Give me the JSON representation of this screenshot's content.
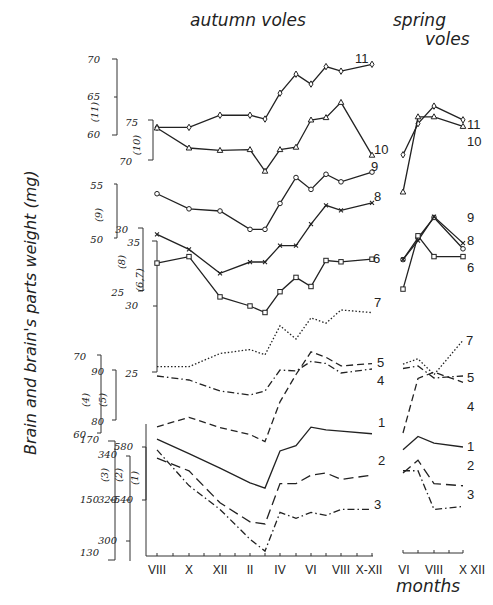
{
  "titles": {
    "autumn": "autumn   voles",
    "spring_line1": "spring",
    "spring_line2": "voles",
    "ylabel": "Brain and brain's parts weight (mg)",
    "xlabel": "months"
  },
  "chart_data": {
    "type": "line",
    "xlabel": "months",
    "ylabel": "Brain and brain's parts weight (mg)",
    "grid": false,
    "panels": [
      {
        "name": "autumn voles",
        "x": [
          "VIII",
          "IX",
          "X",
          "XI",
          "XII",
          "I",
          "II",
          "III",
          "IV",
          "V",
          "VI",
          "VII",
          "VIII",
          "IX",
          "X-XII"
        ],
        "tick_labels": [
          "VIII",
          "X",
          "XII",
          "II",
          "IV",
          "VI",
          "VIII",
          "X-XII"
        ]
      },
      {
        "name": "spring voles",
        "x": [
          "VI",
          "VII",
          "VIII",
          "IX",
          "X",
          "XI",
          "XII"
        ],
        "tick_labels": [
          "VI",
          "VIII",
          "X",
          "XII"
        ]
      }
    ],
    "y_axes": [
      {
        "series": "(11)",
        "ticks": [
          60,
          65,
          70
        ]
      },
      {
        "series": "(10)",
        "ticks": [
          70,
          75
        ]
      },
      {
        "series": "(9)",
        "ticks": [
          50,
          55
        ]
      },
      {
        "series": "(8)",
        "ticks": [
          25,
          30
        ]
      },
      {
        "series": "(6,7)",
        "ticks": [
          25,
          30,
          35
        ]
      },
      {
        "series": "(4)",
        "ticks": [
          60,
          70
        ]
      },
      {
        "series": "(5)",
        "ticks": [
          80,
          90
        ]
      },
      {
        "series": "(3)",
        "ticks": [
          130,
          150,
          170
        ]
      },
      {
        "series": "(2)",
        "ticks": [
          300,
          320,
          340
        ]
      },
      {
        "series": "(1)",
        "ticks": [
          540,
          580
        ]
      }
    ],
    "series": [
      {
        "name": "11",
        "marker": "diamond",
        "style": "solid",
        "autumn": [
          {
            "x": "VIII",
            "y": 61.0
          },
          {
            "x": "X",
            "y": 61.0
          },
          {
            "x": "XII",
            "y": 62.6
          },
          {
            "x": "II",
            "y": 62.6
          },
          {
            "x": "III",
            "y": 62.1
          },
          {
            "x": "IV",
            "y": 65.5
          },
          {
            "x": "V",
            "y": 68.0
          },
          {
            "x": "VI",
            "y": 66.7
          },
          {
            "x": "VII",
            "y": 69.0
          },
          {
            "x": "VIII",
            "y": 68.4
          },
          {
            "x": "X-XII",
            "y": 69.3
          }
        ],
        "spring": [
          {
            "x": "VI",
            "y": 57.4
          },
          {
            "x": "VII",
            "y": 61.5
          },
          {
            "x": "VIII",
            "y": 63.8
          },
          {
            "x": "X",
            "y": 62.0
          }
        ]
      },
      {
        "name": "10",
        "marker": "triangle",
        "style": "solid",
        "autumn": [
          {
            "x": "VIII",
            "y": 74.0
          },
          {
            "x": "X",
            "y": 71.5
          },
          {
            "x": "XII",
            "y": 71.2
          },
          {
            "x": "II",
            "y": 71.3
          },
          {
            "x": "III",
            "y": 68.6
          },
          {
            "x": "IV",
            "y": 71.3
          },
          {
            "x": "V",
            "y": 71.6
          },
          {
            "x": "VI",
            "y": 75.0
          },
          {
            "x": "VII",
            "y": 75.3
          },
          {
            "x": "VIII",
            "y": 77.2
          },
          {
            "x": "X-XII",
            "y": 70.6
          }
        ],
        "spring": [
          {
            "x": "VI",
            "y": 66.0
          },
          {
            "x": "VII",
            "y": 75.4
          },
          {
            "x": "VIII",
            "y": 75.4
          },
          {
            "x": "X",
            "y": 74.2
          }
        ]
      },
      {
        "name": "9",
        "marker": "circle",
        "style": "solid",
        "autumn": [
          {
            "x": "VIII",
            "y": 54.1
          },
          {
            "x": "X",
            "y": 52.7
          },
          {
            "x": "XII",
            "y": 52.5
          },
          {
            "x": "II",
            "y": 50.8
          },
          {
            "x": "III",
            "y": 50.8
          },
          {
            "x": "IV",
            "y": 53.2
          },
          {
            "x": "V",
            "y": 55.6
          },
          {
            "x": "VI",
            "y": 54.5
          },
          {
            "x": "VII",
            "y": 55.9
          },
          {
            "x": "VIII",
            "y": 55.2
          },
          {
            "x": "X-XII",
            "y": 56.1
          }
        ],
        "spring": [
          {
            "x": "VI",
            "y": 48.0
          },
          {
            "x": "VII",
            "y": 50.0
          },
          {
            "x": "VIII",
            "y": 51.9
          },
          {
            "x": "X",
            "y": 49.0
          }
        ]
      },
      {
        "name": "8",
        "marker": "cross",
        "style": "solid",
        "autumn": [
          {
            "x": "VIII",
            "y": 29.5
          },
          {
            "x": "X",
            "y": 28.3
          },
          {
            "x": "XII",
            "y": 26.4
          },
          {
            "x": "II",
            "y": 27.3
          },
          {
            "x": "III",
            "y": 27.3
          },
          {
            "x": "IV",
            "y": 28.6
          },
          {
            "x": "V",
            "y": 28.6
          },
          {
            "x": "VI",
            "y": 30.3
          },
          {
            "x": "VII",
            "y": 31.8
          },
          {
            "x": "VIII",
            "y": 31.4
          },
          {
            "x": "X-XII",
            "y": 32.0
          }
        ],
        "spring": [
          {
            "x": "VI",
            "y": 27.5
          },
          {
            "x": "VII",
            "y": 29.0
          },
          {
            "x": "VIII",
            "y": 30.9
          },
          {
            "x": "X",
            "y": 28.8
          }
        ]
      },
      {
        "name": "6",
        "marker": "square",
        "style": "solid",
        "autumn": [
          {
            "x": "VIII",
            "y": 33.3
          },
          {
            "x": "X",
            "y": 33.8
          },
          {
            "x": "XII",
            "y": 30.7
          },
          {
            "x": "II",
            "y": 30.0
          },
          {
            "x": "III",
            "y": 29.5
          },
          {
            "x": "IV",
            "y": 31.1
          },
          {
            "x": "V",
            "y": 32.2
          },
          {
            "x": "VI",
            "y": 31.5
          },
          {
            "x": "VII",
            "y": 33.5
          },
          {
            "x": "VIII",
            "y": 33.4
          },
          {
            "x": "X-XII",
            "y": 33.6
          }
        ],
        "spring": [
          {
            "x": "VI",
            "y": 31.3
          },
          {
            "x": "VII",
            "y": 35.4
          },
          {
            "x": "VIII",
            "y": 33.8
          },
          {
            "x": "X",
            "y": 33.8
          }
        ]
      },
      {
        "name": "7",
        "marker": "none",
        "style": "dotted",
        "autumn": [
          {
            "x": "VIII",
            "y": 25.4
          },
          {
            "x": "X",
            "y": 25.4
          },
          {
            "x": "XII",
            "y": 26.4
          },
          {
            "x": "II",
            "y": 26.7
          },
          {
            "x": "III",
            "y": 26.3
          },
          {
            "x": "IV",
            "y": 28.5
          },
          {
            "x": "V",
            "y": 27.5
          },
          {
            "x": "VI",
            "y": 29.1
          },
          {
            "x": "VII",
            "y": 28.7
          },
          {
            "x": "VIII",
            "y": 29.7
          },
          {
            "x": "X-XII",
            "y": 29.5
          }
        ],
        "spring": [
          {
            "x": "VI",
            "y": 25.6
          },
          {
            "x": "VII",
            "y": 26.0
          },
          {
            "x": "VIII",
            "y": 24.8
          },
          {
            "x": "X",
            "y": 27.4
          }
        ]
      },
      {
        "name": "5",
        "marker": "none",
        "style": "dash-dot",
        "autumn": [
          {
            "x": "VIII",
            "y": 88.8
          },
          {
            "x": "X",
            "y": 88.0
          },
          {
            "x": "XII",
            "y": 85.8
          },
          {
            "x": "II",
            "y": 85.0
          },
          {
            "x": "III",
            "y": 85.8
          },
          {
            "x": "IV",
            "y": 90.0
          },
          {
            "x": "V",
            "y": 89.8
          },
          {
            "x": "VI",
            "y": 91.7
          },
          {
            "x": "VII",
            "y": 91.3
          },
          {
            "x": "VIII",
            "y": 89.4
          },
          {
            "x": "X-XII",
            "y": 90.2
          }
        ],
        "spring": [
          {
            "x": "VI",
            "y": 90.3
          },
          {
            "x": "VII",
            "y": 90.8
          },
          {
            "x": "VIII",
            "y": 88.4
          },
          {
            "x": "X",
            "y": 88.8
          }
        ]
      },
      {
        "name": "4",
        "marker": "none",
        "style": "dashed",
        "autumn": [
          {
            "x": "VIII",
            "y": 60.8
          },
          {
            "x": "X",
            "y": 62.0
          },
          {
            "x": "XII",
            "y": 60.7
          },
          {
            "x": "II",
            "y": 59.8
          },
          {
            "x": "III",
            "y": 58.9
          },
          {
            "x": "IV",
            "y": 64.0
          },
          {
            "x": "V",
            "y": 67.5
          },
          {
            "x": "VI",
            "y": 70.4
          },
          {
            "x": "VII",
            "y": 69.7
          },
          {
            "x": "VIII",
            "y": 68.6
          },
          {
            "x": "X-XII",
            "y": 68.9
          }
        ],
        "spring": [
          {
            "x": "VI",
            "y": 60.0
          },
          {
            "x": "VII",
            "y": 67.0
          },
          {
            "x": "VIII",
            "y": 67.8
          },
          {
            "x": "X",
            "y": 66.5
          }
        ]
      },
      {
        "name": "1",
        "marker": "none",
        "style": "solid",
        "autumn": [
          {
            "x": "VIII",
            "y": 586
          },
          {
            "x": "X",
            "y": 575
          },
          {
            "x": "XII",
            "y": 564
          },
          {
            "x": "II",
            "y": 553
          },
          {
            "x": "III",
            "y": 549
          },
          {
            "x": "IV",
            "y": 577
          },
          {
            "x": "V",
            "y": 581
          },
          {
            "x": "VI",
            "y": 595
          },
          {
            "x": "VII",
            "y": 593
          },
          {
            "x": "VIII",
            "y": 592
          },
          {
            "x": "X-XII",
            "y": 590
          }
        ],
        "spring": [
          {
            "x": "VI",
            "y": 578
          },
          {
            "x": "VII",
            "y": 588
          },
          {
            "x": "VIII",
            "y": 583
          },
          {
            "x": "X",
            "y": 580
          }
        ]
      },
      {
        "name": "2",
        "marker": "none",
        "style": "long-dash",
        "autumn": [
          {
            "x": "VIII",
            "y": 339
          },
          {
            "x": "X",
            "y": 333
          },
          {
            "x": "XII",
            "y": 318
          },
          {
            "x": "II",
            "y": 309
          },
          {
            "x": "III",
            "y": 308
          },
          {
            "x": "IV",
            "y": 327
          },
          {
            "x": "V",
            "y": 327
          },
          {
            "x": "VI",
            "y": 331
          },
          {
            "x": "VII",
            "y": 332
          },
          {
            "x": "VIII",
            "y": 329
          },
          {
            "x": "X-XII",
            "y": 331
          }
        ],
        "spring": [
          {
            "x": "VI",
            "y": 332
          },
          {
            "x": "VII",
            "y": 338
          },
          {
            "x": "VIII",
            "y": 327
          },
          {
            "x": "X",
            "y": 326
          }
        ]
      },
      {
        "name": "3",
        "marker": "none",
        "style": "dash-dot",
        "autumn": [
          {
            "x": "VIII",
            "y": 167
          },
          {
            "x": "X",
            "y": 155
          },
          {
            "x": "XII",
            "y": 147
          },
          {
            "x": "II",
            "y": 137
          },
          {
            "x": "III",
            "y": 133
          },
          {
            "x": "IV",
            "y": 146
          },
          {
            "x": "V",
            "y": 144
          },
          {
            "x": "VI",
            "y": 146
          },
          {
            "x": "VII",
            "y": 145
          },
          {
            "x": "VIII",
            "y": 147
          },
          {
            "x": "X-XII",
            "y": 147
          }
        ],
        "spring": [
          {
            "x": "VI",
            "y": 160
          },
          {
            "x": "VII",
            "y": 160
          },
          {
            "x": "VIII",
            "y": 147
          },
          {
            "x": "X",
            "y": 148
          }
        ]
      }
    ]
  },
  "axis_labels": [
    {
      "text": "70",
      "x": 100,
      "y": 60
    },
    {
      "text": "65",
      "x": 100,
      "y": 97
    },
    {
      "text": "60",
      "x": 100,
      "y": 135
    },
    {
      "text": "(11)",
      "x": 98,
      "y": 112,
      "rot": true
    },
    {
      "text": "75",
      "x": 138,
      "y": 123
    },
    {
      "text": "70",
      "x": 132,
      "y": 162
    },
    {
      "text": "(10)",
      "x": 140,
      "y": 145,
      "rot": true
    },
    {
      "text": "55",
      "x": 103,
      "y": 186
    },
    {
      "text": "50",
      "x": 103,
      "y": 240
    },
    {
      "text": "(9)",
      "x": 102,
      "y": 215,
      "rot": true
    },
    {
      "text": "30",
      "x": 128,
      "y": 230
    },
    {
      "text": "25",
      "x": 124,
      "y": 293
    },
    {
      "text": "(8)",
      "x": 125,
      "y": 262,
      "rot": true
    },
    {
      "text": "35",
      "x": 140,
      "y": 243
    },
    {
      "text": "30",
      "x": 138,
      "y": 306
    },
    {
      "text": "25",
      "x": 138,
      "y": 374
    },
    {
      "text": "(6,7)",
      "x": 143,
      "y": 280,
      "rot": true
    },
    {
      "text": "70",
      "x": 86,
      "y": 357
    },
    {
      "text": "60",
      "x": 86,
      "y": 435
    },
    {
      "text": "(4)",
      "x": 89,
      "y": 400,
      "rot": true
    },
    {
      "text": "90",
      "x": 104,
      "y": 372
    },
    {
      "text": "80",
      "x": 104,
      "y": 422
    },
    {
      "text": "(5)",
      "x": 106,
      "y": 400,
      "rot": true
    },
    {
      "text": "170",
      "x": 99,
      "y": 440
    },
    {
      "text": "150",
      "x": 99,
      "y": 500
    },
    {
      "text": "130",
      "x": 99,
      "y": 553
    },
    {
      "text": "(3)",
      "x": 108,
      "y": 475,
      "rot": true
    },
    {
      "text": "340",
      "x": 117,
      "y": 455
    },
    {
      "text": "320",
      "x": 117,
      "y": 500
    },
    {
      "text": "300",
      "x": 117,
      "y": 541
    },
    {
      "text": "(2)",
      "x": 122,
      "y": 475,
      "rot": true
    },
    {
      "text": "580",
      "x": 133,
      "y": 447
    },
    {
      "text": "540",
      "x": 133,
      "y": 500
    },
    {
      "text": "(1)",
      "x": 138,
      "y": 478,
      "rot": true
    }
  ],
  "series_labels": [
    {
      "text": "11",
      "x": 355,
      "y": 59
    },
    {
      "text": "10",
      "x": 374,
      "y": 150
    },
    {
      "text": "9",
      "x": 371,
      "y": 167
    },
    {
      "text": "8",
      "x": 374,
      "y": 197
    },
    {
      "text": "6",
      "x": 373,
      "y": 259
    },
    {
      "text": "7",
      "x": 374,
      "y": 303
    },
    {
      "text": "5",
      "x": 377,
      "y": 363
    },
    {
      "text": "4",
      "x": 377,
      "y": 381
    },
    {
      "text": "1",
      "x": 378,
      "y": 423
    },
    {
      "text": "2",
      "x": 378,
      "y": 461
    },
    {
      "text": "3",
      "x": 374,
      "y": 505
    },
    {
      "text": "11",
      "x": 467,
      "y": 125
    },
    {
      "text": "10",
      "x": 467,
      "y": 142
    },
    {
      "text": "9",
      "x": 467,
      "y": 218
    },
    {
      "text": "8",
      "x": 467,
      "y": 241
    },
    {
      "text": "6",
      "x": 467,
      "y": 268
    },
    {
      "text": "7",
      "x": 466,
      "y": 341
    },
    {
      "text": "5",
      "x": 467,
      "y": 378
    },
    {
      "text": "4",
      "x": 467,
      "y": 407
    },
    {
      "text": "1",
      "x": 467,
      "y": 447
    },
    {
      "text": "2",
      "x": 467,
      "y": 466
    },
    {
      "text": "3",
      "x": 467,
      "y": 495
    }
  ],
  "x_ticks_autumn": [
    {
      "text": "VIII",
      "x": 157
    },
    {
      "text": "X",
      "x": 189
    },
    {
      "text": "XII",
      "x": 220
    },
    {
      "text": "II",
      "x": 250
    },
    {
      "text": "IV",
      "x": 280
    },
    {
      "text": "VI",
      "x": 311
    },
    {
      "text": "VIII",
      "x": 341
    },
    {
      "text": "X-XII",
      "x": 369
    }
  ],
  "x_ticks_spring": [
    {
      "text": "VI",
      "x": 404
    },
    {
      "text": "VIII",
      "x": 434
    },
    {
      "text": "X XII",
      "x": 472
    }
  ]
}
